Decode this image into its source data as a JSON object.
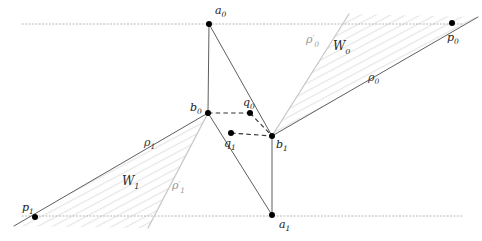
{
  "figure": {
    "background": "#ffffff",
    "width": 482,
    "height": 241,
    "colors": {
      "solid_line": "#555555",
      "faint_line": "#c8c8c8",
      "hatch": "#e2e2e2",
      "dotted_guide": "#b0b0b0",
      "dashed_link": "#333333",
      "point_fill": "#000000",
      "label_text": "#1a1a1a",
      "faint_text": "#9a9a9a"
    }
  },
  "points": [
    {
      "id": "a0",
      "label": "a",
      "sub": "0",
      "x": 209,
      "y": 24,
      "label_x": 215,
      "label_y": 14
    },
    {
      "id": "p0",
      "label": "p",
      "sub": "0",
      "x": 452,
      "y": 23,
      "label_x": 447,
      "label_y": 41
    },
    {
      "id": "b0",
      "label": "b",
      "sub": "0",
      "x": 208,
      "y": 113,
      "label_x": 190,
      "label_y": 111
    },
    {
      "id": "q0",
      "label": "q",
      "sub": "0",
      "x": 250,
      "y": 113,
      "label_x": 243,
      "label_y": 106
    },
    {
      "id": "q1",
      "label": "q",
      "sub": "1",
      "x": 231,
      "y": 133,
      "label_x": 224,
      "label_y": 147
    },
    {
      "id": "b1",
      "label": "b",
      "sub": "1",
      "x": 272,
      "y": 136,
      "label_x": 276,
      "label_y": 148
    },
    {
      "id": "p1",
      "label": "p",
      "sub": "1",
      "x": 35,
      "y": 217,
      "label_x": 22,
      "label_y": 211
    },
    {
      "id": "a1",
      "label": "a",
      "sub": "1",
      "x": 272,
      "y": 215,
      "label_x": 279,
      "label_y": 228
    }
  ],
  "guide_lines": [
    {
      "name": "upper-horizontal-guide",
      "x1": 22,
      "y1": 24,
      "x2": 462,
      "y2": 24
    },
    {
      "name": "lower-horizontal-guide",
      "x1": 22,
      "y1": 216,
      "x2": 462,
      "y2": 216
    }
  ],
  "solid_segments": [
    {
      "name": "a0-b0",
      "x1": 209,
      "y1": 24,
      "x2": 208,
      "y2": 113
    },
    {
      "name": "a0-b1",
      "x1": 209,
      "y1": 24,
      "x2": 272,
      "y2": 136
    },
    {
      "name": "b1-a1",
      "x1": 272,
      "y1": 136,
      "x2": 272,
      "y2": 215
    },
    {
      "name": "b0-a1",
      "x1": 208,
      "y1": 113,
      "x2": 272,
      "y2": 215
    },
    {
      "name": "rho0-ray",
      "x1": 272,
      "y1": 136,
      "x2": 478,
      "y2": 17
    },
    {
      "name": "rho1-ray",
      "x1": 208,
      "y1": 113,
      "x2": 14,
      "y2": 226
    },
    {
      "name": "b0-q0-dash-x",
      "x1": 208,
      "y1": 113,
      "x2": 272,
      "y2": 136
    }
  ],
  "faint_segments": [
    {
      "name": "rho0-prime-ray",
      "x1": 272,
      "y1": 136,
      "x2": 349,
      "y2": 14
    },
    {
      "name": "rho1-prime-ray",
      "x1": 208,
      "y1": 113,
      "x2": 148,
      "y2": 228
    }
  ],
  "dashed_segments": [
    {
      "name": "b0-to-q0",
      "x1": 208,
      "y1": 113,
      "x2": 250,
      "y2": 113
    },
    {
      "name": "q0-to-b1",
      "x1": 250,
      "y1": 113,
      "x2": 272,
      "y2": 136
    },
    {
      "name": "q1-to-b1",
      "x1": 231,
      "y1": 133,
      "x2": 272,
      "y2": 136
    }
  ],
  "wedges": [
    {
      "id": "W0",
      "label": "W",
      "sub": "0",
      "label_x": 333,
      "label_y": 50,
      "apex_x": 272,
      "apex_y": 136,
      "edge1_x": 478,
      "edge1_y": 17,
      "edge2_x": 349,
      "edge2_y": 14
    },
    {
      "id": "W1",
      "label": "W",
      "sub": "1",
      "label_x": 122,
      "label_y": 185,
      "apex_x": 208,
      "apex_y": 113,
      "edge1_x": 14,
      "edge1_y": 226,
      "edge2_x": 148,
      "edge2_y": 228
    }
  ],
  "ray_labels": [
    {
      "id": "rho0",
      "label": "ρ",
      "sub": "0",
      "prime": false,
      "x": 368,
      "y": 81,
      "faint": false
    },
    {
      "id": "rho0_prime",
      "label": "ρ",
      "sub": "0",
      "prime": true,
      "x": 306,
      "y": 43,
      "faint": true
    },
    {
      "id": "rho1",
      "label": "ρ",
      "sub": "1",
      "prime": false,
      "x": 144,
      "y": 146,
      "faint": false
    },
    {
      "id": "rho1_prime",
      "label": "ρ",
      "sub": "1",
      "prime": true,
      "x": 172,
      "y": 189,
      "faint": true
    }
  ]
}
